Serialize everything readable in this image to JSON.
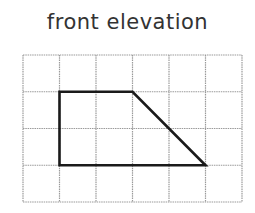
{
  "title": "front elevation",
  "grid": {
    "columns": 6,
    "rows": 4,
    "origin_x": 23,
    "origin_y": 55,
    "cell_w": 36.5,
    "cell_h": 36.75,
    "line_color": "#9a9a9a"
  },
  "shape": {
    "type": "trapezoid",
    "vertices_grid": [
      [
        1,
        1
      ],
      [
        3,
        1
      ],
      [
        5,
        3
      ],
      [
        1,
        3
      ]
    ],
    "stroke_color": "#1a1a1a"
  }
}
